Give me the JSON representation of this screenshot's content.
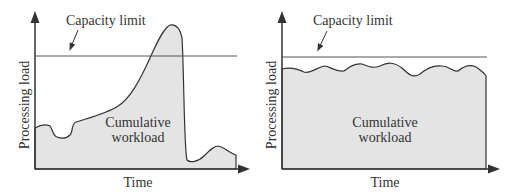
{
  "figure": {
    "colors": {
      "fill": "#e4e4e4",
      "stroke": "#333333",
      "background": "#ffffff"
    },
    "panels": [
      {
        "id": "left",
        "capacity_label": "Capacity limit",
        "area_label_line1": "Cumulative",
        "area_label_line2": "workload",
        "ylabel": "Processing load",
        "xlabel": "Time",
        "description": "Fluctuating workload that peaks above capacity limit then drops sharply"
      },
      {
        "id": "right",
        "capacity_label": "Capacity limit",
        "area_label_line1": "Cumulative",
        "area_label_line2": "workload",
        "ylabel": "Processing load",
        "xlabel": "Time",
        "description": "Leveled workload that stays just below capacity limit"
      }
    ]
  }
}
